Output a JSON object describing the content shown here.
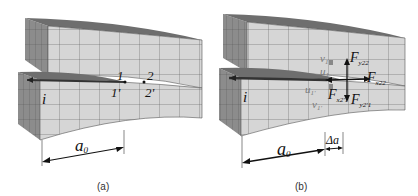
{
  "figure": {
    "panels": [
      {
        "id": "a",
        "caption": "(a)",
        "labels": {
          "crack_tip_start": "i",
          "node_1_top": "1",
          "node_1_bottom": "1'",
          "node_2_top": "2",
          "node_2_bottom": "2'",
          "crack_length": "a₀"
        }
      },
      {
        "id": "b",
        "caption": "(b)",
        "labels": {
          "crack_tip_start": "i",
          "v_top": "v₁",
          "u_top": "u₁",
          "u_bottom": "u₁'",
          "v_bottom": "v₁'",
          "force_y_top": "Fᵧ₂₂",
          "force_x_top": "Fₓ₂₂",
          "force_x_bottom": "Fₓ₂'₁",
          "force_y_bottom": "Fᵧ₂'₁",
          "crack_length": "a₀",
          "crack_increment": "Δa"
        },
        "label_text": {
          "force_y_top": "F",
          "force_y_top_sub": "y22",
          "force_x_top": "F",
          "force_x_top_sub": "x22",
          "force_x_bottom": "F",
          "force_x_bottom_sub": "x2'1",
          "force_y_bottom": "F",
          "force_y_bottom_sub": "y2'1",
          "v_top": "v",
          "v_top_sub": "1",
          "u_top": "u",
          "u_top_sub": "1",
          "u_bottom": "u",
          "u_bottom_sub": "1'",
          "v_bottom": "v",
          "v_bottom_sub": "1'",
          "a": "a",
          "a_sub": "0",
          "delta_a": "Δa"
        }
      }
    ],
    "colors": {
      "mesh_face": "#d6d6d6",
      "mesh_side": "#8c8c8c",
      "mesh_top": "#6e6e6e",
      "grid_line": "#5a5a5a",
      "crack": "#444444",
      "text": "#111111"
    }
  },
  "panel_a_text": {
    "a": "a",
    "a_sub": "0"
  }
}
